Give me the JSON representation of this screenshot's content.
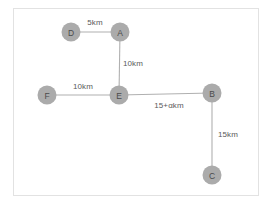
{
  "diagram": {
    "title": "",
    "canvas": {
      "width": 273,
      "height": 210,
      "background_color": "#ffffff",
      "border_color": "#e2e2e2"
    },
    "style": {
      "node_fill": "#ababab",
      "node_radius": 9.5,
      "edge_color": "#b0b0b0",
      "node_label_color": "#4a4a4a",
      "edge_label_color": "#5a5a5a"
    },
    "nodes": [
      {
        "id": "D",
        "label": "D",
        "x": 71,
        "y": 32
      },
      {
        "id": "A",
        "label": "A",
        "x": 120,
        "y": 32
      },
      {
        "id": "E",
        "label": "E",
        "x": 119,
        "y": 95
      },
      {
        "id": "F",
        "label": "F",
        "x": 47,
        "y": 95
      },
      {
        "id": "B",
        "label": "B",
        "x": 212,
        "y": 93
      },
      {
        "id": "C",
        "label": "C",
        "x": 212,
        "y": 175
      }
    ],
    "edges": [
      {
        "from": "D",
        "to": "A",
        "label": "5km",
        "label_x": 95,
        "label_y": 22
      },
      {
        "from": "A",
        "to": "E",
        "label": "10km",
        "label_x": 133,
        "label_y": 63
      },
      {
        "from": "F",
        "to": "E",
        "label": "10km",
        "label_x": 83,
        "label_y": 86
      },
      {
        "from": "E",
        "to": "B",
        "label": "15+αkm",
        "label_x": 169,
        "label_y": 105
      },
      {
        "from": "B",
        "to": "C",
        "label": "15km",
        "label_x": 228,
        "label_y": 134
      }
    ]
  }
}
